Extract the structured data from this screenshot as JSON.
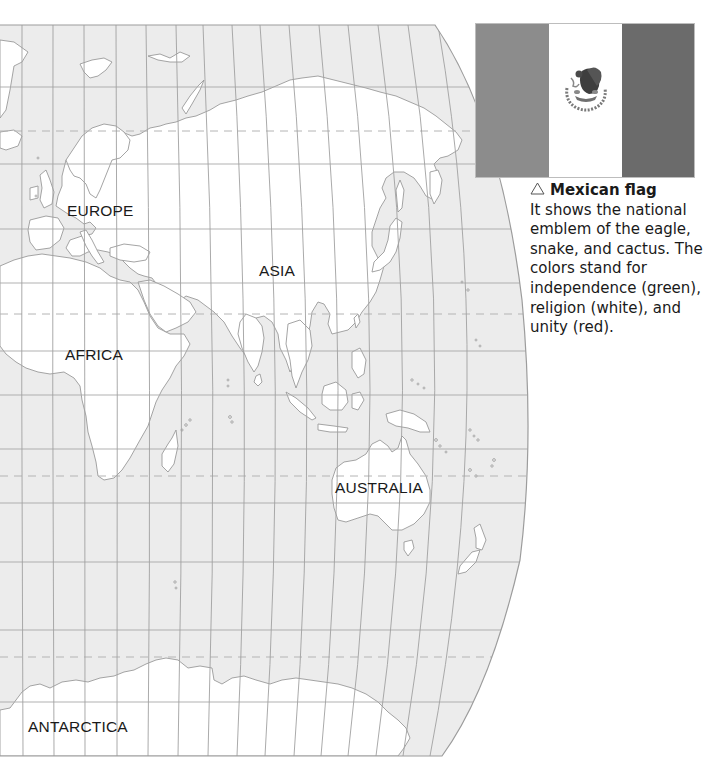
{
  "map": {
    "ocean_color": "#ececec",
    "land_color": "#ffffff",
    "coast_color": "#9a9a9a",
    "grid_color": "#a8a8a8",
    "labels": [
      {
        "name": "EUROPE",
        "x": 67,
        "y": 203
      },
      {
        "name": "ASIA",
        "x": 259,
        "y": 263
      },
      {
        "name": "AFRICA",
        "x": 65,
        "y": 347
      },
      {
        "name": "AUSTRALIA",
        "x": 335,
        "y": 480
      },
      {
        "name": "ANTARCTICA",
        "x": 28,
        "y": 719
      }
    ],
    "special_parallels": [
      "Arctic Circle",
      "Tropic of Cancer",
      "Tropic of Capricorn",
      "Antarctic Circle"
    ]
  },
  "flag": {
    "name": "Mexican flag",
    "stripes": [
      {
        "color_name": "green",
        "display_color": "#8c8c8c"
      },
      {
        "color_name": "white",
        "display_color": "#ffffff"
      },
      {
        "color_name": "red",
        "display_color": "#6b6b6b"
      }
    ],
    "emblem": "eagle-snake-cactus-emblem"
  },
  "caption": {
    "icon": "triangle-up-outline-icon",
    "title": "Mexican flag",
    "body": "It shows the national emblem of the eagle, snake, and cactus. The colors stand for independence (green), religion (white), and unity (red)."
  }
}
